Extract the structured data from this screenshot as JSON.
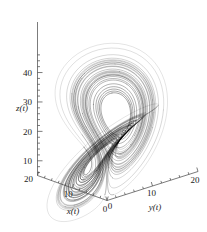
{
  "figure": {
    "type": "3d-phase-portrait",
    "background_color": "#ffffff",
    "line_color": "#000000",
    "width": 207,
    "height": 232
  },
  "axes": {
    "z": {
      "label": "z(t)",
      "ticks": [
        "10",
        "20",
        "30",
        "40"
      ],
      "tick_values": [
        10,
        20,
        30,
        40
      ]
    },
    "x": {
      "label": "x(t)",
      "ticks": [
        "20",
        "10",
        "0"
      ],
      "tick_values": [
        20,
        10,
        0
      ]
    },
    "y": {
      "label": "y(t)",
      "ticks": [
        "20",
        "10",
        "0"
      ],
      "tick_values": [
        20,
        10,
        0
      ]
    }
  },
  "chart_data": {
    "type": "line",
    "title": "",
    "xlabel": "x(t)",
    "ylabel": "y(t)",
    "zlabel": "z(t)",
    "projection": "3d",
    "grid": false,
    "legend": null,
    "xlim": [
      -25,
      25
    ],
    "ylim": [
      -25,
      25
    ],
    "zlim": [
      5,
      48
    ],
    "xticks": [
      0,
      10,
      20
    ],
    "yticks": [
      0,
      10,
      20
    ],
    "zticks": [
      10,
      20,
      30,
      40
    ],
    "system": "lorenz",
    "parameters": {
      "sigma": 10,
      "rho": 28,
      "beta": 2.6667
    },
    "initial_condition": [
      1,
      1,
      20
    ],
    "dt": 0.006,
    "steps": 7200
  }
}
